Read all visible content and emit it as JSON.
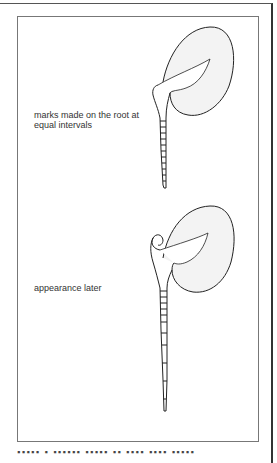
{
  "figure": {
    "labels": {
      "top": "marks made on the root at equal intervals",
      "bottom": "appearance later"
    },
    "caption_visible_fragment": "Figure 1  ...  (caption cut off at bottom edge)",
    "seedlings": [
      {
        "name": "seedling-initial",
        "root_marks_count": 12,
        "description": "marks evenly spaced along root"
      },
      {
        "name": "seedling-later",
        "root_marks_count": 12,
        "description": "marks near tip spaced further apart after growth"
      }
    ],
    "colors": {
      "cotyledon_fill": "#f3f3f3",
      "stroke": "#222222",
      "frame": "#777777"
    }
  }
}
